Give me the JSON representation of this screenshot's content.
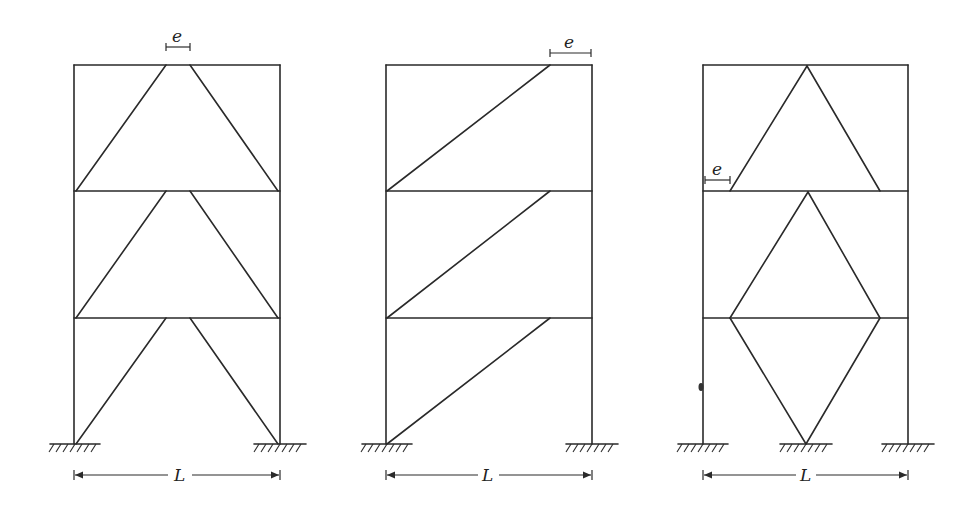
{
  "figure": {
    "stroke_color": "#2a2a2a",
    "frames": [
      {
        "id": "frame-1",
        "name": "Chevron (inverted-V) eccentric bracing",
        "eccentricity_label": "e",
        "span_label": "L"
      },
      {
        "id": "frame-2",
        "name": "Single diagonal eccentric bracing",
        "eccentricity_label": "e",
        "span_label": "L"
      },
      {
        "id": "frame-3",
        "name": "Diamond / inverted-V eccentric bracing at column",
        "eccentricity_label": "e",
        "span_label": "L"
      }
    ]
  }
}
